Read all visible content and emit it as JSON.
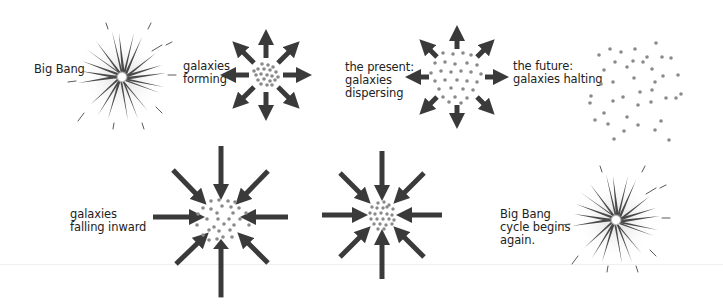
{
  "diagram": {
    "colors": {
      "arrow": "#3a3a3a",
      "dot": "#8a8a8a",
      "text": "#222222",
      "burst": "#4a4a4a",
      "glow": "#d8d8d8"
    },
    "stages": [
      {
        "id": "big-bang",
        "label": "Big Bang",
        "type": "burst",
        "center": [
          122,
          77
        ]
      },
      {
        "id": "galaxies-forming",
        "label": "galaxies\nforming",
        "type": "outward-arrows",
        "center": [
          266,
          75
        ]
      },
      {
        "id": "present",
        "label": "the present:\ngalaxies\ndispersing",
        "type": "outward-arrows",
        "center": [
          457,
          77
        ]
      },
      {
        "id": "future",
        "label": "the future:\ngalaxies halting",
        "type": "scattered-dots",
        "center": [
          640,
          90
        ]
      },
      {
        "id": "falling-inward",
        "label": "galaxies\nfalling inward",
        "type": "inward-arrows",
        "center": [
          221,
          217
        ]
      },
      {
        "id": "contracting",
        "label": "",
        "type": "inward-arrows",
        "center": [
          382,
          215
        ]
      },
      {
        "id": "big-bang-again",
        "label": "Big Bang\ncycle begins\nagain.",
        "type": "burst",
        "center": [
          616,
          220
        ]
      }
    ]
  }
}
